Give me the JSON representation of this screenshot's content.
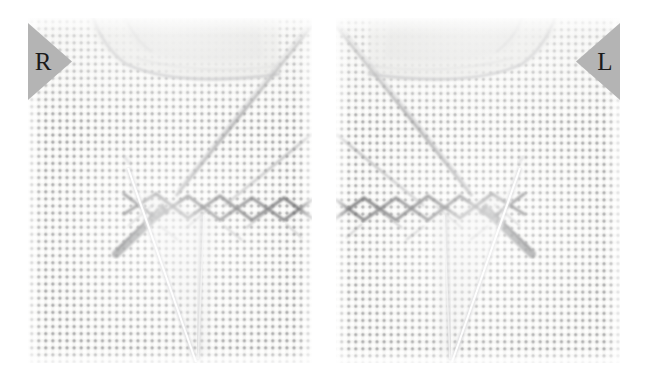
{
  "image": {
    "modality": "radiograph",
    "view_count": 2,
    "background_color": "#ffffff",
    "panel_background_color": "#f4f4f2",
    "grid_dot_color": "#78787a",
    "marker_fill_color": "#b4b4b4",
    "marker_text_color": "#1a1a1a",
    "hardware_color": "#6e6e70",
    "bone_outline_color": "#b9b9bb"
  },
  "panels": [
    {
      "id": "panel-right-knee",
      "laterality_label": "R",
      "laterality_name": "right",
      "marker_side": "left",
      "x": 28,
      "y": 18,
      "width": 284,
      "height": 345,
      "features": [
        {
          "name": "anti-scatter-grid-texture",
          "description": "regular dot lattice, ~7.1 px pitch"
        },
        {
          "name": "bone-cortex-curve-upper",
          "description": "faint curved cortical outline across upper third"
        },
        {
          "name": "diagonal-radiodense-band",
          "description": "oblique band descending from upper-right to center"
        },
        {
          "name": "zigzag-staple-row",
          "description": "chevron / X-shaped metallic staple chain across mid-field"
        },
        {
          "name": "threaded-screw",
          "description": "threaded screw angled down-left from the chain"
        },
        {
          "name": "v-wire-converging-lines",
          "description": "two bright wires meeting at a point low in the field"
        }
      ]
    },
    {
      "id": "panel-left-knee",
      "laterality_label": "L",
      "laterality_name": "left",
      "marker_side": "right",
      "x": 336,
      "y": 18,
      "width": 284,
      "height": 345,
      "features": [
        {
          "name": "anti-scatter-grid-texture",
          "description": "regular dot lattice, ~7.1 px pitch"
        },
        {
          "name": "bone-cortex-curve-upper",
          "description": "faint curved cortical outline across upper third"
        },
        {
          "name": "diagonal-radiodense-band",
          "description": "oblique band descending from upper-left to center"
        },
        {
          "name": "zigzag-staple-row",
          "description": "chevron / X-shaped metallic staple chain across mid-field"
        },
        {
          "name": "threaded-screw",
          "description": "threaded screw angled down-right from the chain"
        },
        {
          "name": "v-wire-converging-lines",
          "description": "two bright wires meeting at a point low in the field"
        }
      ]
    }
  ]
}
